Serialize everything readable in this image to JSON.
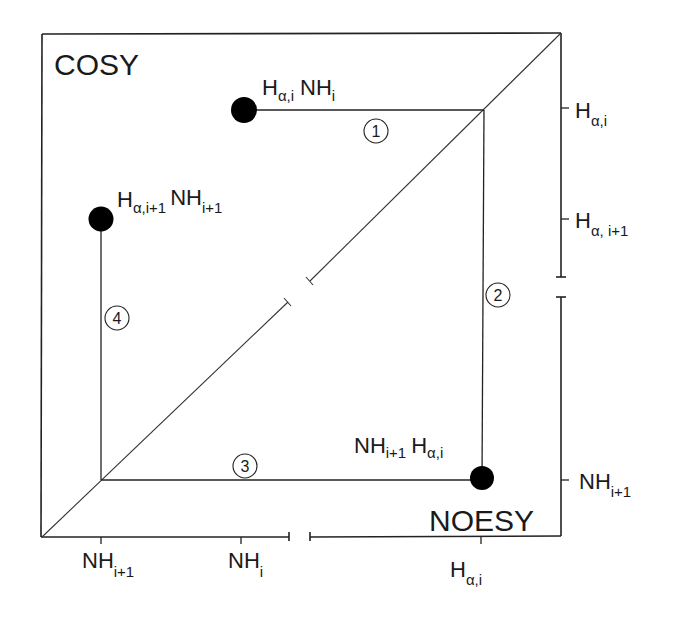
{
  "diagram": {
    "regions": {
      "upper_left": "COSY",
      "lower_right": "NOESY"
    },
    "cross_peaks": [
      {
        "id": "peak-alpha-i-nh-i",
        "main": "H",
        "sub": "α,i",
        "main2": "NH",
        "sub2": "i"
      },
      {
        "id": "peak-alpha-i1-nh-i1",
        "main": "H",
        "sub": "α,i+1",
        "main2": "NH",
        "sub2": "i+1"
      },
      {
        "id": "peak-nh-i1-alpha-i",
        "main": "NH",
        "sub": "i+1",
        "main2": "H",
        "sub2": "α,i"
      }
    ],
    "path_steps": [
      "1",
      "2",
      "3",
      "4"
    ],
    "right_axis_ticks": [
      {
        "main": "H",
        "sub": "α,i"
      },
      {
        "main": "H",
        "sub": "α, i+1"
      },
      {
        "main": "NH",
        "sub": "i+1"
      }
    ],
    "bottom_axis_ticks": [
      {
        "main": "NH",
        "sub": "i+1"
      },
      {
        "main": "NH",
        "sub": "i"
      },
      {
        "main": "H",
        "sub": "α,i"
      }
    ],
    "colors": {
      "ink": "#1a1a1a",
      "background": "#ffffff"
    }
  }
}
